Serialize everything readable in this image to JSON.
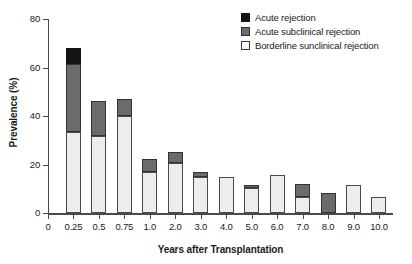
{
  "chart_data": {
    "type": "bar",
    "subtype": "stacked",
    "title": "",
    "xlabel": "Years after Transplantation",
    "ylabel": "Prevalence (%)",
    "ylim": [
      0,
      80
    ],
    "yticks": [
      0,
      20,
      40,
      60,
      80
    ],
    "ytick_labels": [
      "0",
      "20",
      "40",
      "60",
      "80"
    ],
    "grid": false,
    "legend_position": "top-right",
    "categories": [
      "0.25",
      "0.5",
      "0.75",
      "1.0",
      "2.0",
      "3.0",
      "4.0",
      "5.0",
      "6.0",
      "7.0",
      "8.0",
      "9.0",
      "10.0"
    ],
    "xtick_labels": [
      "0",
      "0.25",
      "0.5",
      "0.75",
      "1.0",
      "2.0",
      "3.0",
      "4.0",
      "5.0",
      "6.0",
      "7.0",
      "8.0",
      "9.0",
      "10.0"
    ],
    "series": [
      {
        "name": "Borderline sunclinical rejection",
        "color": "#ededed",
        "values": [
          33.5,
          31.8,
          40.0,
          17.0,
          20.8,
          14.7,
          15.0,
          10.5,
          15.6,
          6.8,
          0.0,
          11.6,
          6.5
        ]
      },
      {
        "name": "Acute subclinical rejection",
        "color": "#6b6b6b",
        "values": [
          28.0,
          14.4,
          7.1,
          5.4,
          4.5,
          2.4,
          0.0,
          1.1,
          0.0,
          5.1,
          8.4,
          0.0,
          0.0
        ]
      },
      {
        "name": "Acute rejection",
        "color": "#141414",
        "values": [
          6.5,
          0.0,
          0.0,
          0.0,
          0.0,
          0.0,
          0.0,
          0.0,
          0.0,
          0.0,
          0.0,
          0.0,
          0.0
        ]
      }
    ],
    "totals": [
      68.0,
      46.2,
      47.1,
      22.4,
      25.3,
      17.1,
      15.0,
      11.6,
      15.6,
      11.9,
      8.4,
      11.6,
      6.5
    ]
  },
  "legend": {
    "items": [
      {
        "label": "Acute rejection",
        "swatch": "black-square-swatch"
      },
      {
        "label": "Acute subclinical rejection",
        "swatch": "dark-gray-square-swatch"
      },
      {
        "label": "Borderline sunclinical rejection",
        "swatch": "light-square-swatch"
      }
    ]
  },
  "axes": {
    "y_title": "Prevalence (%)",
    "x_title": "Years after Transplantation"
  }
}
